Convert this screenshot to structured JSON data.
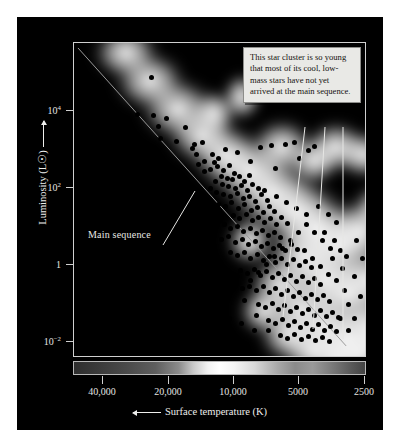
{
  "figure": {
    "background_color": "#000000",
    "page_background_color": "#ffffff"
  },
  "annotation": {
    "text": "This star cluster is so young that most of its cool, low-mass stars have not yet arrived at the main sequence."
  },
  "labels": {
    "main_sequence": "Main sequence"
  },
  "chart_data": {
    "type": "scatter",
    "title": "",
    "subtitle": "",
    "xlabel": "Surface temperature (K)",
    "ylabel": "Luminosity (L☉)",
    "xlabel_arrow": "left",
    "ylabel_arrow": "up",
    "x_scale": "log-reversed",
    "y_scale": "log",
    "xlim": [
      50000,
      2200
    ],
    "ylim": [
      0.001,
      100000.0
    ],
    "grid": false,
    "legend": null,
    "xticks": [
      {
        "value": 40000,
        "label": "40,000",
        "px": 85
      },
      {
        "value": 20000,
        "label": "20,000",
        "px": 151
      },
      {
        "value": 10000,
        "label": "10,000",
        "px": 216
      },
      {
        "value": 5000,
        "label": "5000",
        "px": 281
      },
      {
        "value": 2500,
        "label": "2500",
        "px": 347
      }
    ],
    "yticks": [
      {
        "value": 10000,
        "label": "10",
        "exp": "4",
        "px": 93
      },
      {
        "value": 100,
        "label": "10",
        "exp": "2",
        "px": 170
      },
      {
        "value": 1,
        "label": "1",
        "exp": "",
        "px": 247
      },
      {
        "value": 0.01,
        "label": "10",
        "exp": "−2",
        "px": 324
      }
    ],
    "main_sequence_line": {
      "x1_px": 60,
      "y1_px": 30,
      "x2_px": 330,
      "y2_px": 330,
      "color": "#9a9a9a",
      "description": "Zero-age main sequence running from hot luminous upper-left to cool faint lower-right"
    },
    "spectrum_bar": {
      "present": true,
      "description": "Grayscale stellar spectrum strip below plot, brightest near 10,000 K"
    },
    "point_color": "#000000",
    "point_count": 216,
    "points_px": [
      [
        133,
        59
      ],
      [
        119,
        96
      ],
      [
        135,
        97
      ],
      [
        148,
        100
      ],
      [
        140,
        108
      ],
      [
        167,
        109
      ],
      [
        142,
        120
      ],
      [
        158,
        123
      ],
      [
        176,
        126
      ],
      [
        174,
        130
      ],
      [
        178,
        136
      ],
      [
        184,
        124
      ],
      [
        194,
        136
      ],
      [
        180,
        146
      ],
      [
        186,
        143
      ],
      [
        196,
        144
      ],
      [
        200,
        140
      ],
      [
        207,
        131
      ],
      [
        219,
        134
      ],
      [
        232,
        143
      ],
      [
        242,
        129
      ],
      [
        253,
        127
      ],
      [
        257,
        150
      ],
      [
        267,
        126
      ],
      [
        276,
        124
      ],
      [
        281,
        140
      ],
      [
        290,
        132
      ],
      [
        296,
        128
      ],
      [
        186,
        153
      ],
      [
        192,
        151
      ],
      [
        199,
        148
      ],
      [
        205,
        152
      ],
      [
        211,
        147
      ],
      [
        216,
        155
      ],
      [
        203,
        158
      ],
      [
        209,
        160
      ],
      [
        214,
        161
      ],
      [
        221,
        158
      ],
      [
        226,
        163
      ],
      [
        231,
        157
      ],
      [
        197,
        163
      ],
      [
        204,
        166
      ],
      [
        210,
        168
      ],
      [
        217,
        170
      ],
      [
        223,
        167
      ],
      [
        229,
        172
      ],
      [
        234,
        166
      ],
      [
        240,
        170
      ],
      [
        192,
        170
      ],
      [
        198,
        174
      ],
      [
        205,
        176
      ],
      [
        212,
        178
      ],
      [
        219,
        175
      ],
      [
        225,
        180
      ],
      [
        231,
        178
      ],
      [
        237,
        183
      ],
      [
        243,
        176
      ],
      [
        249,
        182
      ],
      [
        200,
        186
      ],
      [
        207,
        188
      ],
      [
        213,
        184
      ],
      [
        220,
        190
      ],
      [
        226,
        186
      ],
      [
        233,
        192
      ],
      [
        239,
        189
      ],
      [
        245,
        194
      ],
      [
        251,
        188
      ],
      [
        256,
        193
      ],
      [
        215,
        197
      ],
      [
        221,
        200
      ],
      [
        228,
        196
      ],
      [
        234,
        202
      ],
      [
        240,
        199
      ],
      [
        246,
        204
      ],
      [
        252,
        200
      ],
      [
        258,
        206
      ],
      [
        263,
        199
      ],
      [
        269,
        205
      ],
      [
        206,
        206
      ],
      [
        212,
        210
      ],
      [
        219,
        208
      ],
      [
        225,
        213
      ],
      [
        232,
        210
      ],
      [
        238,
        215
      ],
      [
        244,
        212
      ],
      [
        250,
        217
      ],
      [
        256,
        214
      ],
      [
        262,
        219
      ],
      [
        196,
        216
      ],
      [
        203,
        221
      ],
      [
        210,
        218
      ],
      [
        217,
        224
      ],
      [
        224,
        221
      ],
      [
        230,
        226
      ],
      [
        237,
        223
      ],
      [
        243,
        228
      ],
      [
        249,
        225
      ],
      [
        255,
        230
      ],
      [
        261,
        227
      ],
      [
        267,
        232
      ],
      [
        273,
        226
      ],
      [
        279,
        231
      ],
      [
        212,
        234
      ],
      [
        219,
        237
      ],
      [
        226,
        234
      ],
      [
        232,
        240
      ],
      [
        239,
        236
      ],
      [
        245,
        242
      ],
      [
        251,
        238
      ],
      [
        257,
        244
      ],
      [
        263,
        240
      ],
      [
        269,
        246
      ],
      [
        275,
        241
      ],
      [
        281,
        247
      ],
      [
        287,
        243
      ],
      [
        293,
        249
      ],
      [
        222,
        252
      ],
      [
        229,
        255
      ],
      [
        236,
        251
      ],
      [
        242,
        257
      ],
      [
        248,
        253
      ],
      [
        254,
        259
      ],
      [
        260,
        255
      ],
      [
        266,
        261
      ],
      [
        272,
        257
      ],
      [
        278,
        263
      ],
      [
        284,
        258
      ],
      [
        290,
        264
      ],
      [
        296,
        260
      ],
      [
        302,
        266
      ],
      [
        231,
        268
      ],
      [
        238,
        272
      ],
      [
        245,
        268
      ],
      [
        251,
        274
      ],
      [
        257,
        270
      ],
      [
        263,
        276
      ],
      [
        269,
        272
      ],
      [
        275,
        278
      ],
      [
        281,
        274
      ],
      [
        287,
        280
      ],
      [
        293,
        276
      ],
      [
        299,
        281
      ],
      [
        305,
        277
      ],
      [
        311,
        283
      ],
      [
        240,
        286
      ],
      [
        247,
        289
      ],
      [
        254,
        285
      ],
      [
        260,
        291
      ],
      [
        266,
        287
      ],
      [
        272,
        293
      ],
      [
        278,
        289
      ],
      [
        284,
        295
      ],
      [
        290,
        291
      ],
      [
        296,
        297
      ],
      [
        302,
        292
      ],
      [
        308,
        298
      ],
      [
        314,
        294
      ],
      [
        320,
        299
      ],
      [
        250,
        302
      ],
      [
        257,
        305
      ],
      [
        264,
        301
      ],
      [
        270,
        307
      ],
      [
        276,
        303
      ],
      [
        282,
        309
      ],
      [
        288,
        305
      ],
      [
        294,
        311
      ],
      [
        300,
        306
      ],
      [
        306,
        312
      ],
      [
        312,
        308
      ],
      [
        318,
        313
      ],
      [
        262,
        317
      ],
      [
        269,
        320
      ],
      [
        276,
        316
      ],
      [
        283,
        321
      ],
      [
        290,
        318
      ],
      [
        297,
        322
      ],
      [
        304,
        319
      ],
      [
        311,
        323
      ],
      [
        185,
        205
      ],
      [
        175,
        228
      ],
      [
        190,
        246
      ],
      [
        202,
        260
      ],
      [
        214,
        271
      ],
      [
        226,
        282
      ],
      [
        238,
        297
      ],
      [
        250,
        312
      ],
      [
        199,
        290
      ],
      [
        211,
        300
      ],
      [
        223,
        305
      ],
      [
        236,
        312
      ],
      [
        180,
        181
      ],
      [
        168,
        196
      ],
      [
        160,
        174
      ],
      [
        246,
        172
      ],
      [
        258,
        178
      ],
      [
        268,
        184
      ],
      [
        278,
        190
      ],
      [
        288,
        196
      ],
      [
        300,
        188
      ],
      [
        310,
        196
      ],
      [
        318,
        204
      ],
      [
        306,
        214
      ],
      [
        316,
        222
      ],
      [
        322,
        232
      ],
      [
        314,
        240
      ],
      [
        324,
        250
      ],
      [
        318,
        262
      ],
      [
        326,
        272
      ],
      [
        310,
        256
      ],
      [
        302,
        248
      ],
      [
        294,
        240
      ],
      [
        286,
        232
      ],
      [
        330,
        286
      ],
      [
        336,
        300
      ],
      [
        328,
        238
      ],
      [
        336,
        258
      ],
      [
        322,
        300
      ],
      [
        330,
        312
      ],
      [
        342,
        278
      ],
      [
        338,
        222
      ],
      [
        344,
        240
      ],
      [
        312,
        230
      ],
      [
        304,
        222
      ],
      [
        296,
        214
      ],
      [
        288,
        206
      ],
      [
        280,
        214
      ],
      [
        272,
        222
      ],
      [
        264,
        230
      ],
      [
        256,
        238
      ],
      [
        248,
        246
      ],
      [
        240,
        254
      ],
      [
        232,
        262
      ],
      [
        224,
        270
      ]
    ],
    "glow_blobs_px": [
      [
        52,
        10,
        74,
        60
      ],
      [
        76,
        38,
        80,
        66
      ],
      [
        104,
        66,
        84,
        70
      ],
      [
        128,
        92,
        78,
        66
      ],
      [
        152,
        112,
        80,
        70
      ],
      [
        140,
        70,
        52,
        52
      ],
      [
        168,
        54,
        46,
        54
      ],
      [
        176,
        128,
        92,
        78
      ],
      [
        198,
        150,
        96,
        84
      ],
      [
        222,
        168,
        94,
        82
      ],
      [
        208,
        104,
        72,
        64
      ],
      [
        240,
        118,
        62,
        54
      ],
      [
        262,
        104,
        70,
        58
      ],
      [
        290,
        112,
        62,
        54
      ],
      [
        244,
        186,
        92,
        82
      ],
      [
        266,
        204,
        92,
        84
      ],
      [
        286,
        188,
        74,
        70
      ],
      [
        306,
        166,
        64,
        60
      ],
      [
        228,
        214,
        84,
        78
      ],
      [
        250,
        236,
        90,
        82
      ],
      [
        274,
        252,
        92,
        84
      ],
      [
        296,
        236,
        76,
        70
      ],
      [
        206,
        242,
        70,
        66
      ],
      [
        226,
        266,
        80,
        76
      ],
      [
        250,
        284,
        84,
        80
      ],
      [
        274,
        296,
        80,
        76
      ],
      [
        296,
        282,
        70,
        66
      ],
      [
        190,
        268,
        58,
        56
      ],
      [
        214,
        292,
        66,
        62
      ],
      [
        238,
        308,
        70,
        66
      ],
      [
        262,
        318,
        66,
        62
      ],
      [
        286,
        312,
        64,
        60
      ],
      [
        306,
        300,
        58,
        56
      ],
      [
        320,
        276,
        54,
        52
      ],
      [
        316,
        214,
        52,
        52
      ],
      [
        330,
        240,
        50,
        50
      ],
      [
        176,
        198,
        54,
        56
      ]
    ],
    "leader_lines_px": [
      {
        "x1": 288,
        "y1": 110,
        "x2": 266,
        "y2": 300
      },
      {
        "x1": 308,
        "y1": 110,
        "x2": 296,
        "y2": 312
      },
      {
        "x1": 326,
        "y1": 110,
        "x2": 326,
        "y2": 322
      },
      {
        "x1": 146,
        "y1": 228,
        "x2": 178,
        "y2": 174
      }
    ]
  }
}
